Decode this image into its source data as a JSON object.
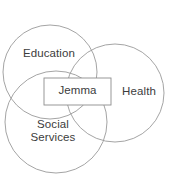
{
  "diagram": {
    "type": "venn-three-circle-with-center-box",
    "background_color": "#ffffff",
    "stroke_color": "#9a9a9a",
    "text_color": "#3c3c3c",
    "center_box_fill": "#ffffff",
    "center_box_stroke": "#8d8d8d",
    "circles": [
      {
        "name": "education",
        "label": "Education",
        "cx": 50,
        "cy": 72,
        "r": 47
      },
      {
        "name": "health",
        "label": "Health",
        "cx": 115,
        "cy": 93,
        "r": 49
      },
      {
        "name": "social-services",
        "label": "Social\nServices",
        "cx": 56,
        "cy": 122,
        "r": 51
      }
    ],
    "center_box": {
      "name": "jemma",
      "label": "Jemma",
      "x": 44,
      "y": 78,
      "width": 67,
      "height": 27
    }
  }
}
